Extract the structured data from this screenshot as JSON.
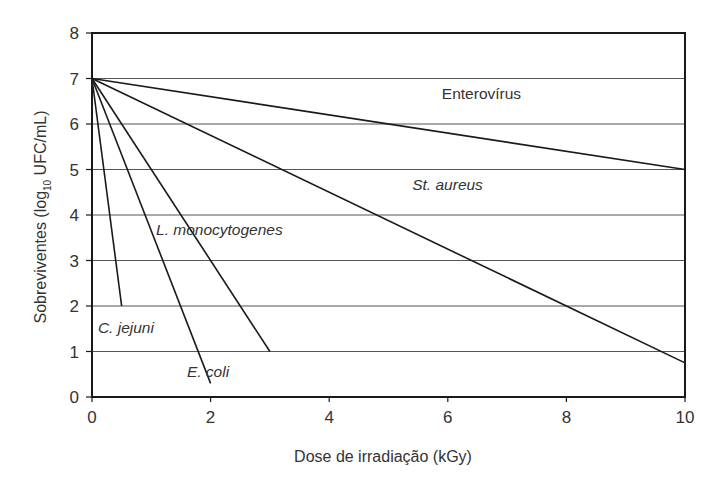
{
  "chart_data": {
    "type": "line",
    "title": "",
    "xlabel": "Dose de irradiação (kGy)",
    "ylabel": "Sobreviventes (log10 UFC/mL)",
    "ylabel_parts": {
      "pre": "Sobreviventes (log",
      "sub": "10",
      "post": " UFC/mL)"
    },
    "xlim": [
      0,
      10
    ],
    "ylim": [
      0,
      8
    ],
    "xticks": [
      0,
      2,
      4,
      6,
      8,
      10
    ],
    "yticks": [
      0,
      1,
      2,
      3,
      4,
      5,
      6,
      7,
      8
    ],
    "grid": {
      "horizontal": true,
      "vertical": false
    },
    "legend": "inline labels",
    "series": [
      {
        "name": "Enterovírus",
        "italic": false,
        "points": [
          [
            0,
            7
          ],
          [
            10,
            5
          ]
        ],
        "label_pos": [
          5.9,
          6.55
        ]
      },
      {
        "name": "St. aureus",
        "italic": true,
        "points": [
          [
            0,
            7
          ],
          [
            10,
            0.75
          ]
        ],
        "label_pos": [
          5.4,
          4.55
        ]
      },
      {
        "name": "L. monocytogenes",
        "italic": true,
        "points": [
          [
            0,
            7
          ],
          [
            3,
            1
          ]
        ],
        "label_pos": [
          1.08,
          3.55
        ]
      },
      {
        "name": "C. jejuni",
        "italic": true,
        "points": [
          [
            0,
            7
          ],
          [
            0.5,
            2
          ]
        ],
        "label_pos": [
          0.1,
          1.4
        ]
      },
      {
        "name": "E. coli",
        "italic": true,
        "points": [
          [
            0,
            7
          ],
          [
            2,
            0.3
          ]
        ],
        "label_pos": [
          1.6,
          0.45
        ]
      }
    ]
  },
  "colors": {
    "line": "#1a1a1a",
    "grid": "#555555",
    "frame": "#1a1a1a",
    "text": "#333333",
    "background": "#ffffff"
  }
}
